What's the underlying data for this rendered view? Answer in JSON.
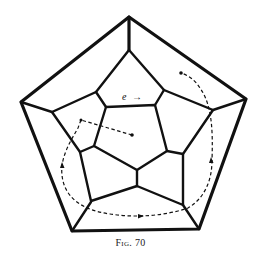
{
  "figure": {
    "caption": "Fig. 70",
    "edge_label": "e",
    "edge_arrow": "→"
  },
  "colors": {
    "line": "#111111",
    "background": "#ffffff"
  }
}
